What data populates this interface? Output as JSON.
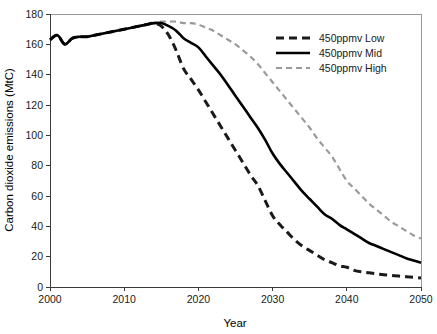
{
  "chart_data": {
    "type": "line",
    "title": "",
    "xlabel": "Year",
    "ylabel": "Carbon dioxide emissions (MtC)",
    "xlim": [
      2000,
      2050
    ],
    "ylim": [
      0,
      180
    ],
    "xticks": [
      2000,
      2010,
      2020,
      2030,
      2040,
      2050
    ],
    "yticks": [
      0,
      20,
      40,
      60,
      80,
      100,
      120,
      140,
      160,
      180
    ],
    "xtick_labels": [
      "2000",
      "2010",
      "2020",
      "2030",
      "2040",
      "2050"
    ],
    "ytick_labels": [
      "0",
      "20",
      "40",
      "60",
      "80",
      "100",
      "120",
      "140",
      "160",
      "180"
    ],
    "grid": false,
    "legend_position": "top-right",
    "x": [
      2000,
      2001,
      2002,
      2003,
      2004,
      2005,
      2006,
      2007,
      2008,
      2009,
      2010,
      2011,
      2012,
      2013,
      2014,
      2015,
      2016,
      2017,
      2018,
      2019,
      2020,
      2021,
      2022,
      2023,
      2024,
      2025,
      2026,
      2027,
      2028,
      2029,
      2030,
      2031,
      2032,
      2033,
      2034,
      2035,
      2036,
      2037,
      2038,
      2039,
      2040,
      2041,
      2042,
      2043,
      2044,
      2045,
      2046,
      2047,
      2048,
      2049,
      2050
    ],
    "series": [
      {
        "name": "450ppmv Low",
        "color": "#1a1a1a",
        "style": "dashed",
        "width": 3.0,
        "values": [
          163,
          166,
          160,
          164,
          165,
          165,
          166,
          167,
          168,
          169,
          170,
          171,
          172,
          173,
          174,
          172,
          166,
          156,
          144,
          137,
          130,
          122,
          114,
          106,
          98,
          90,
          82,
          74,
          67,
          57,
          47,
          41,
          36,
          31,
          27,
          24,
          21,
          18,
          16,
          14,
          13,
          11,
          10,
          9.4,
          8.7,
          8.1,
          7.6,
          7.2,
          6.8,
          6.4,
          6
        ]
      },
      {
        "name": "450ppmv Mid",
        "color": "#000000",
        "style": "solid",
        "width": 2.6,
        "values": [
          163,
          166,
          160,
          164,
          165,
          165,
          166,
          167,
          168,
          169,
          170,
          171,
          172,
          173,
          174,
          174,
          172,
          169,
          164,
          161,
          158,
          152,
          146,
          140,
          133,
          126,
          119,
          112,
          105,
          97,
          88,
          81,
          75,
          69,
          63,
          58,
          53,
          48,
          45,
          41,
          38,
          35,
          32,
          29,
          27,
          25,
          23,
          21,
          19,
          17.5,
          16
        ]
      },
      {
        "name": "450ppmv High",
        "color": "#9a9a9a",
        "style": "dashed",
        "width": 2.2,
        "values": [
          163,
          166,
          160,
          164,
          165,
          165,
          166,
          167,
          168,
          169,
          170,
          171,
          172,
          173,
          174,
          175,
          175,
          175,
          174,
          174,
          173,
          171,
          169,
          166,
          163,
          160,
          156,
          152,
          147,
          141,
          135,
          129,
          123,
          117,
          111,
          105,
          98,
          92,
          86,
          78,
          70,
          65,
          60,
          55,
          51,
          47,
          43,
          40,
          37,
          34,
          32
        ]
      }
    ],
    "legend": [
      {
        "label": "450ppmv Low",
        "color": "#1a1a1a",
        "style": "dashed"
      },
      {
        "label": "450ppmv Mid",
        "color": "#000000",
        "style": "solid"
      },
      {
        "label": "450ppmv High",
        "color": "#9a9a9a",
        "style": "dashed"
      }
    ]
  }
}
